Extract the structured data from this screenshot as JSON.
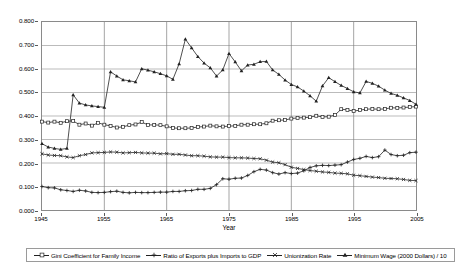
{
  "chart_data": {
    "type": "line",
    "title": "",
    "xlabel": "Year",
    "ylabel": "",
    "xlim": [
      1945,
      2005
    ],
    "ylim": [
      0.0,
      0.8
    ],
    "grid": true,
    "legend_position": "bottom",
    "x_ticks": [
      "1945",
      "1955",
      "1965",
      "1975",
      "1985",
      "1995",
      "2005"
    ],
    "y_ticks": [
      "0.000",
      "0.100",
      "0.200",
      "0.300",
      "0.400",
      "0.500",
      "0.600",
      "0.700",
      "0.800"
    ],
    "x": [
      1945,
      1946,
      1947,
      1948,
      1949,
      1950,
      1951,
      1952,
      1953,
      1954,
      1955,
      1956,
      1957,
      1958,
      1959,
      1960,
      1961,
      1962,
      1963,
      1964,
      1965,
      1966,
      1967,
      1968,
      1969,
      1970,
      1971,
      1972,
      1973,
      1974,
      1975,
      1976,
      1977,
      1978,
      1979,
      1980,
      1981,
      1982,
      1983,
      1984,
      1985,
      1986,
      1987,
      1988,
      1989,
      1990,
      1991,
      1992,
      1993,
      1994,
      1995,
      1996,
      1997,
      1998,
      1999,
      2000,
      2001,
      2002,
      2003,
      2004,
      2005
    ],
    "series": [
      {
        "name": "Gini Coefficient for Family Income",
        "marker": "open-square",
        "color": "#222222",
        "values": [
          0.376,
          0.372,
          0.376,
          0.371,
          0.378,
          0.379,
          0.363,
          0.368,
          0.359,
          0.371,
          0.363,
          0.358,
          0.351,
          0.354,
          0.361,
          0.364,
          0.374,
          0.362,
          0.362,
          0.361,
          0.356,
          0.349,
          0.348,
          0.348,
          0.349,
          0.353,
          0.355,
          0.359,
          0.356,
          0.355,
          0.357,
          0.358,
          0.363,
          0.363,
          0.365,
          0.365,
          0.369,
          0.38,
          0.382,
          0.383,
          0.389,
          0.392,
          0.393,
          0.395,
          0.401,
          0.396,
          0.397,
          0.404,
          0.429,
          0.426,
          0.421,
          0.425,
          0.429,
          0.43,
          0.429,
          0.43,
          0.435,
          0.434,
          0.436,
          0.438,
          0.44
        ]
      },
      {
        "name": "Ratio of Exports plus Imports to GDP",
        "marker": "plus",
        "color": "#222222",
        "values": [
          0.1,
          0.095,
          0.094,
          0.086,
          0.083,
          0.079,
          0.084,
          0.081,
          0.075,
          0.074,
          0.075,
          0.078,
          0.08,
          0.075,
          0.073,
          0.075,
          0.074,
          0.074,
          0.075,
          0.076,
          0.076,
          0.079,
          0.079,
          0.082,
          0.083,
          0.088,
          0.088,
          0.092,
          0.108,
          0.133,
          0.131,
          0.135,
          0.136,
          0.147,
          0.163,
          0.173,
          0.17,
          0.159,
          0.153,
          0.159,
          0.155,
          0.157,
          0.167,
          0.181,
          0.188,
          0.19,
          0.189,
          0.191,
          0.193,
          0.204,
          0.215,
          0.22,
          0.228,
          0.223,
          0.227,
          0.255,
          0.236,
          0.231,
          0.233,
          0.244,
          0.246
        ]
      },
      {
        "name": "Unionization Rate",
        "marker": "cross",
        "color": "#222222",
        "values": [
          0.239,
          0.234,
          0.232,
          0.231,
          0.226,
          0.223,
          0.231,
          0.236,
          0.243,
          0.244,
          0.245,
          0.247,
          0.246,
          0.243,
          0.244,
          0.245,
          0.243,
          0.242,
          0.242,
          0.239,
          0.24,
          0.237,
          0.237,
          0.234,
          0.231,
          0.231,
          0.229,
          0.226,
          0.225,
          0.225,
          0.223,
          0.222,
          0.222,
          0.221,
          0.219,
          0.218,
          0.212,
          0.204,
          0.201,
          0.193,
          0.182,
          0.177,
          0.172,
          0.168,
          0.165,
          0.162,
          0.16,
          0.157,
          0.156,
          0.154,
          0.148,
          0.146,
          0.143,
          0.14,
          0.138,
          0.135,
          0.134,
          0.133,
          0.13,
          0.126,
          0.125
        ]
      },
      {
        "name": "Minimum Wage (2000 Dollars) / 10",
        "marker": "filled-triangle",
        "color": "#222222",
        "values": [
          0.282,
          0.268,
          0.262,
          0.258,
          0.262,
          0.49,
          0.455,
          0.447,
          0.443,
          0.44,
          0.437,
          0.588,
          0.57,
          0.554,
          0.55,
          0.545,
          0.601,
          0.595,
          0.588,
          0.58,
          0.571,
          0.556,
          0.622,
          0.727,
          0.69,
          0.653,
          0.625,
          0.605,
          0.57,
          0.596,
          0.666,
          0.63,
          0.592,
          0.617,
          0.62,
          0.631,
          0.632,
          0.596,
          0.577,
          0.553,
          0.534,
          0.524,
          0.506,
          0.486,
          0.463,
          0.528,
          0.563,
          0.546,
          0.53,
          0.517,
          0.503,
          0.498,
          0.547,
          0.539,
          0.527,
          0.51,
          0.496,
          0.488,
          0.477,
          0.466,
          0.45
        ]
      }
    ]
  },
  "legend": {
    "entries": [
      {
        "label": "Gini Coefficient for Family Income",
        "marker": "open-square"
      },
      {
        "label": "Ratio of Exports plus Imports to GDP",
        "marker": "plus"
      },
      {
        "label": "Unionization Rate",
        "marker": "cross"
      },
      {
        "label": "Minimum Wage (2000 Dollars) / 10",
        "marker": "filled-triangle"
      }
    ]
  }
}
